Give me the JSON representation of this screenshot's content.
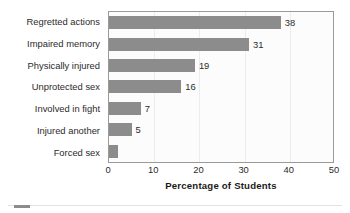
{
  "chart_data": {
    "type": "bar",
    "orientation": "horizontal",
    "title": "",
    "xlabel": "Percentage of Students",
    "ylabel": "",
    "xlim": [
      0,
      50
    ],
    "xticks": [
      0,
      10,
      20,
      30,
      40,
      50
    ],
    "grid": true,
    "legend": null,
    "bar_color": "#8c8c8c",
    "categories": [
      "Regretted actions",
      "Impaired memory",
      "Physically injured",
      "Unprotected sex",
      "Involved in fight",
      "Injured another",
      "Forced sex"
    ],
    "values": [
      38,
      31,
      19,
      16,
      7,
      5,
      2
    ],
    "data_labels": [
      "38",
      "31",
      "19",
      "16",
      "7",
      "5",
      ""
    ]
  },
  "axis": {
    "xlabel": "Percentage of Students",
    "tick_labels": [
      "0",
      "10",
      "20",
      "30",
      "40",
      "50"
    ]
  }
}
